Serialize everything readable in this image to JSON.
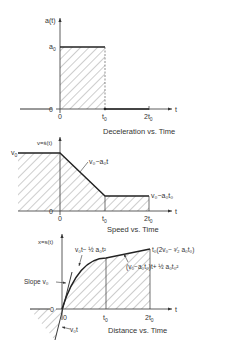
{
  "diagram": {
    "panels": [
      {
        "id": "deceleration",
        "title": "Deceleration vs. Time",
        "y_axis_label": "a(t)",
        "x_axis_label": "t",
        "level_label": "a",
        "level_sub": "0",
        "origin_label": "0",
        "zero_label": "0",
        "tick1": "t",
        "tick1_sub": "0",
        "tick2": "2t",
        "tick2_sub": "0"
      },
      {
        "id": "speed",
        "title": "Speed vs. Time",
        "y_axis_label": "v=ṡ(t)",
        "x_axis_label": "t",
        "level_label": "v",
        "level_sub": "0",
        "ramp_label": "v₀−a₀t",
        "tail_label": "v₀−a₀t₀",
        "origin_label": "0",
        "zero_label": "0",
        "tick1": "t",
        "tick1_sub": "0",
        "tick2": "2t",
        "tick2_sub": "0"
      },
      {
        "id": "distance",
        "title": "Distance vs. Time",
        "y_axis_label": "x=s(t)",
        "x_axis_label": "t",
        "curve_label": "v₀t− ½ a₀t²",
        "line_label": "(v₀−a₀t₀)t+ ½ a₀t₀²",
        "end_label": "t₀(2v₀− ³⁄₂ a₀t₀)",
        "slope_label": "Slope v₀",
        "tangent_label": "v₀t",
        "origin_label": "0",
        "zero_label": "0",
        "tick1": "t",
        "tick1_sub": "0",
        "tick2": "2t",
        "tick2_sub": "0"
      }
    ]
  }
}
